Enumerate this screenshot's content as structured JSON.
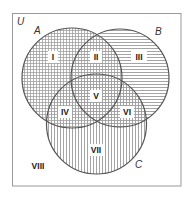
{
  "diagram": {
    "type": "venn",
    "universe_label": "U",
    "sets": [
      {
        "label": "A",
        "cx": 72,
        "cy": 78,
        "r": 50,
        "hatch": "grid"
      },
      {
        "label": "B",
        "cx": 120,
        "cy": 78,
        "r": 49,
        "hatch": "horizontal"
      },
      {
        "label": "C",
        "cx": 96.5,
        "cy": 124,
        "r": 50,
        "hatch": "vertical"
      }
    ],
    "regions": [
      {
        "label": "I",
        "x": 53,
        "y": 57
      },
      {
        "label": "II",
        "x": 96,
        "y": 57
      },
      {
        "label": "III",
        "x": 139,
        "y": 57
      },
      {
        "label": "IV",
        "x": 65,
        "y": 112
      },
      {
        "label": "V",
        "x": 96,
        "y": 96
      },
      {
        "label": "VI",
        "x": 127,
        "y": 112
      },
      {
        "label": "VII",
        "x": 96,
        "y": 150
      },
      {
        "label": "VIII",
        "x": 38,
        "y": 166
      }
    ],
    "colors": {
      "stroke": "#555555",
      "hatch": "#9a9a9a",
      "border": "#999999",
      "background": "#ffffff"
    }
  }
}
